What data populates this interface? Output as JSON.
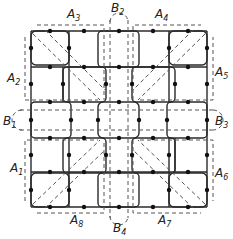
{
  "diagram": {
    "type": "grid-partition",
    "colors": {
      "line": "#2a2a2a",
      "dash": "#555555",
      "node": "#111111",
      "background": "#ffffff"
    },
    "labels": {
      "A1": {
        "main": "A",
        "sub": "1"
      },
      "A2": {
        "main": "A",
        "sub": "2"
      },
      "A3": {
        "main": "A",
        "sub": "3"
      },
      "A4": {
        "main": "A",
        "sub": "4"
      },
      "A5": {
        "main": "A",
        "sub": "5"
      },
      "A6": {
        "main": "A",
        "sub": "6"
      },
      "A7": {
        "main": "A",
        "sub": "7"
      },
      "A8": {
        "main": "A",
        "sub": "8"
      },
      "B1": {
        "main": "B",
        "sub": "1"
      },
      "B2": {
        "main": "B",
        "sub": "2"
      },
      "B3": {
        "main": "B",
        "sub": "3"
      },
      "B4": {
        "main": "B",
        "sub": "4"
      }
    },
    "regions": {
      "A": [
        "A1",
        "A2",
        "A3",
        "A4",
        "A5",
        "A6",
        "A7",
        "A8"
      ],
      "B": [
        "B1",
        "B2",
        "B3",
        "B4"
      ]
    }
  }
}
